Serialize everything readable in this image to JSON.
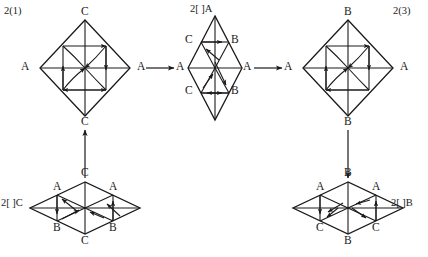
{
  "figure": {
    "background_color": "#ffffff",
    "stroke_color": "#1a1a1a",
    "panels": [
      {
        "id": "panel-top-left",
        "tag": "2(1)",
        "tag_pos": [
          4,
          6
        ],
        "shape": "diamond",
        "center": [
          85,
          68
        ],
        "half_width": 45,
        "half_height": 48,
        "vertex_labels": [
          {
            "text": "C",
            "x": 81,
            "y": 10
          },
          {
            "text": "A",
            "x": 21,
            "y": 64
          },
          {
            "text": "A",
            "x": 137,
            "y": 64
          },
          {
            "text": "C",
            "x": 81,
            "y": 120
          }
        ]
      },
      {
        "id": "panel-top-middle",
        "tag": "2[ ]A",
        "tag_pos": [
          190,
          4
        ],
        "shape": "narrow-diamond",
        "center": [
          215,
          68
        ],
        "half_width": 27,
        "half_height": 52,
        "vertex_labels": [
          {
            "text": "C",
            "x": 186,
            "y": 37
          },
          {
            "text": "B",
            "x": 232,
            "y": 37
          },
          {
            "text": "A",
            "x": 176,
            "y": 64
          },
          {
            "text": "A",
            "x": 243,
            "y": 64
          },
          {
            "text": "C",
            "x": 186,
            "y": 88
          },
          {
            "text": "B",
            "x": 232,
            "y": 88
          }
        ]
      },
      {
        "id": "panel-top-right",
        "tag": "2(3)",
        "tag_pos": [
          393,
          6
        ],
        "shape": "diamond",
        "center": [
          348,
          68
        ],
        "half_width": 45,
        "half_height": 48,
        "vertex_labels": [
          {
            "text": "B",
            "x": 344,
            "y": 10
          },
          {
            "text": "A",
            "x": 284,
            "y": 64
          },
          {
            "text": "A",
            "x": 400,
            "y": 64
          },
          {
            "text": "B",
            "x": 344,
            "y": 120
          }
        ]
      },
      {
        "id": "panel-bottom-left",
        "tag": "2[ ]C",
        "tag_pos": [
          1,
          194
        ],
        "shape": "flat-diamond",
        "center": [
          85,
          208
        ],
        "half_width": 55,
        "half_height": 28,
        "vertex_labels": [
          {
            "text": "C",
            "x": 81,
            "y": 172
          },
          {
            "text": "A",
            "x": 55,
            "y": 185
          },
          {
            "text": "A",
            "x": 111,
            "y": 185
          },
          {
            "text": "B",
            "x": 55,
            "y": 226
          },
          {
            "text": "B",
            "x": 111,
            "y": 226
          },
          {
            "text": "C",
            "x": 81,
            "y": 239
          }
        ]
      },
      {
        "id": "panel-bottom-right",
        "tag": "2[ ]B",
        "tag_pos": [
          391,
          194
        ],
        "shape": "flat-diamond",
        "center": [
          348,
          208
        ],
        "half_width": 55,
        "half_height": 28,
        "vertex_labels": [
          {
            "text": "B",
            "x": 344,
            "y": 172
          },
          {
            "text": "A",
            "x": 318,
            "y": 185
          },
          {
            "text": "A",
            "x": 374,
            "y": 185
          },
          {
            "text": "C",
            "x": 318,
            "y": 226
          },
          {
            "text": "C",
            "x": 374,
            "y": 226
          },
          {
            "text": "B",
            "x": 344,
            "y": 239
          }
        ]
      }
    ],
    "connectors": [
      {
        "id": "arrow-left-to-middle",
        "from": [
          146,
          68
        ],
        "to": [
          176,
          68
        ],
        "direction": "right"
      },
      {
        "id": "arrow-middle-to-right",
        "from": [
          254,
          68
        ],
        "to": [
          284,
          68
        ],
        "direction": "right"
      },
      {
        "id": "arrow-bottomleft-up",
        "from": [
          85,
          178
        ],
        "to": [
          85,
          128
        ],
        "direction": "up"
      },
      {
        "id": "arrow-topright-down",
        "from": [
          348,
          128
        ],
        "to": [
          348,
          178
        ],
        "direction": "down"
      }
    ]
  }
}
